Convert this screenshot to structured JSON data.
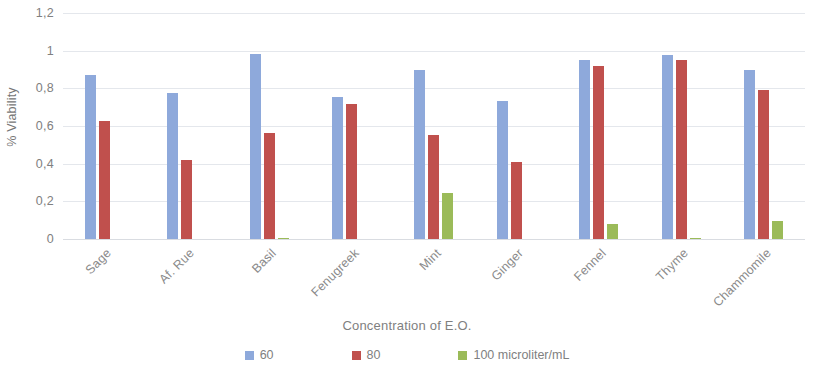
{
  "chart_data": {
    "type": "bar",
    "title": "",
    "xlabel": "Concentration  of E.O.",
    "ylabel": "% Viability",
    "ylim": [
      0,
      1.2
    ],
    "grid": true,
    "legend_position": "bottom",
    "ytick_labels": [
      "1,2",
      "1",
      "0,8",
      "0,6",
      "0,4",
      "0,2",
      "0"
    ],
    "ytick_values": [
      1.2,
      1.0,
      0.8,
      0.6,
      0.4,
      0.2,
      0
    ],
    "categories": [
      "Sage",
      "Af. Rue",
      "Basil",
      "Fenugreek",
      "Mint",
      "Ginger",
      "Fennel",
      "Thyme",
      "Chammomile"
    ],
    "series": [
      {
        "name": "60",
        "color": "#8ea9db",
        "values": [
          0.87,
          0.775,
          0.985,
          0.755,
          0.895,
          0.735,
          0.95,
          0.975,
          0.9
        ]
      },
      {
        "name": "80",
        "color": "#c0504d",
        "values": [
          0.625,
          0.42,
          0.565,
          0.715,
          0.55,
          0.41,
          0.92,
          0.95,
          0.79
        ]
      },
      {
        "name": "100 microliter/mL",
        "color": "#9bbb59",
        "values": [
          0,
          0,
          0.005,
          0,
          0.245,
          0,
          0.08,
          0.002,
          0.095
        ]
      }
    ]
  },
  "legend": {
    "items": [
      {
        "label": "60",
        "color": "#8ea9db"
      },
      {
        "label": "80",
        "color": "#c0504d"
      },
      {
        "label": "100 microliter/mL",
        "color": "#9bbb59"
      }
    ]
  }
}
